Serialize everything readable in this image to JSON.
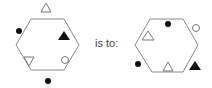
{
  "analogy": {
    "connector_text": "is to:",
    "stroke_color": "#888888",
    "fill_color": "#111111",
    "left_figure": {
      "shape": "hexagon",
      "elements": [
        {
          "type": "triangle-up",
          "fill": "open",
          "position": "outside-top"
        },
        {
          "type": "dot",
          "fill": "filled",
          "position": "outside-upper-left"
        },
        {
          "type": "triangle-up",
          "fill": "filled",
          "position": "inside-upper-right"
        },
        {
          "type": "triangle-down",
          "fill": "open",
          "position": "inside-lower-left"
        },
        {
          "type": "circle",
          "fill": "open",
          "position": "inside-lower-right"
        },
        {
          "type": "dot",
          "fill": "filled",
          "position": "outside-bottom"
        }
      ]
    },
    "right_figure": {
      "shape": "hexagon",
      "elements": [
        {
          "type": "dot",
          "fill": "filled",
          "position": "inside-top"
        },
        {
          "type": "triangle-up",
          "fill": "open",
          "position": "inside-upper-left"
        },
        {
          "type": "circle",
          "fill": "open",
          "position": "outside-upper-right"
        },
        {
          "type": "dot",
          "fill": "filled",
          "position": "outside-lower-left"
        },
        {
          "type": "triangle-up",
          "fill": "open",
          "position": "inside-bottom"
        },
        {
          "type": "triangle-up",
          "fill": "filled",
          "position": "outside-lower-right"
        }
      ]
    }
  }
}
